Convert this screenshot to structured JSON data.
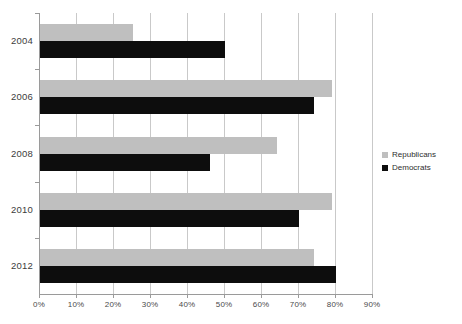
{
  "chart_data": {
    "type": "bar",
    "orientation": "horizontal",
    "title": "",
    "subtitle": "",
    "xlabel": "",
    "ylabel": "",
    "categories": [
      "2004",
      "2006",
      "2008",
      "2010",
      "2012"
    ],
    "series": [
      {
        "name": "Republicans",
        "color": "#bfbfbf",
        "values": [
          25,
          79,
          64,
          79,
          74
        ]
      },
      {
        "name": "Democrats",
        "color": "#0d0d0d",
        "values": [
          50,
          74,
          46,
          70,
          80
        ]
      }
    ],
    "xlim": [
      0,
      90
    ],
    "xtick_values": [
      0,
      10,
      20,
      30,
      40,
      50,
      60,
      70,
      80,
      90
    ],
    "xtick_labels": [
      "0%",
      "10%",
      "20%",
      "30%",
      "40%",
      "50%",
      "60%",
      "70%",
      "80%",
      "90%"
    ],
    "grid": true,
    "grid_axis": "x",
    "legend": [
      "Republicans",
      "Democrats"
    ],
    "legend_position": "right",
    "value_suffix": "%"
  }
}
